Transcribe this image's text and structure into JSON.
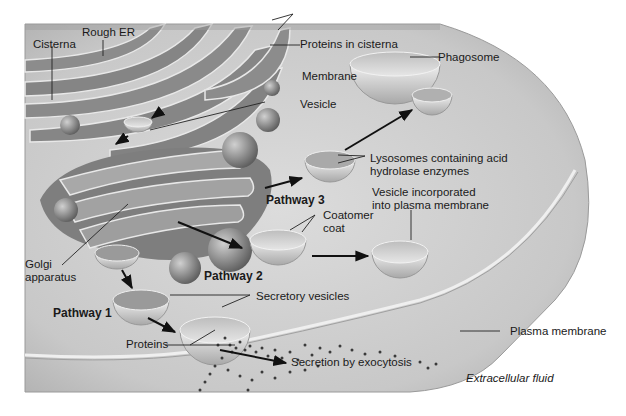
{
  "diagram": {
    "palette": {
      "background": "#ffffff",
      "cytoplasm": "#c9c9c9",
      "cytoplasm_light": "#e2e2e2",
      "organelle": "#8e8e8e",
      "organelle_dark": "#6a6a6a",
      "membrane_highlight": "#e8e8e8",
      "text": "#1a1a1a",
      "arrow": "#111111",
      "dots": "#3a3a3a"
    },
    "labels": {
      "cisterna": "Cisterna",
      "rough_er": "Rough ER",
      "proteins_in_cisterna": "Proteins in cisterna",
      "membrane": "Membrane",
      "vesicle": "Vesicle",
      "phagosome": "Phagosome",
      "lysosomes_line1": "Lysosomes containing acid",
      "lysosomes_line2": "hydrolase enzymes",
      "pathway3": "Pathway 3",
      "vesicle_incorporated_line1": "Vesicle incorporated",
      "vesicle_incorporated_line2": "into plasma membrane",
      "coatomer_line1": "Coatomer",
      "coatomer_line2": "coat",
      "golgi_line1": "Golgi",
      "golgi_line2": "apparatus",
      "pathway2": "Pathway 2",
      "secretory_vesicles": "Secretory vesicles",
      "pathway1": "Pathway 1",
      "proteins": "Proteins",
      "plasma_membrane": "Plasma membrane",
      "secretion": "Secretion by exocytosis",
      "extracellular_fluid": "Extracellular fluid"
    }
  }
}
